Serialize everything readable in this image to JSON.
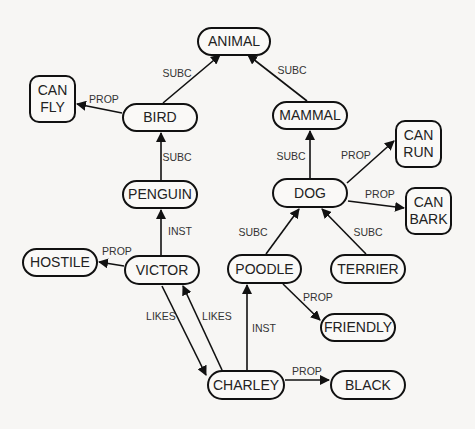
{
  "diagram": {
    "type": "semantic-network",
    "colors": {
      "background": "#f7f6f4",
      "stroke": "#111111",
      "text": "#222222"
    },
    "nodes": [
      {
        "id": "animal",
        "label": "ANIMAL",
        "shape": "pill",
        "x": 197,
        "y": 27,
        "w": 74,
        "h": 29
      },
      {
        "id": "canfly",
        "label": "CAN\nFLY",
        "shape": "box",
        "x": 29,
        "y": 75,
        "w": 47,
        "h": 48
      },
      {
        "id": "bird",
        "label": "BIRD",
        "shape": "pill",
        "x": 122,
        "y": 103,
        "w": 76,
        "h": 29
      },
      {
        "id": "mammal",
        "label": "MAMMAL",
        "shape": "pill",
        "x": 272,
        "y": 101,
        "w": 76,
        "h": 29
      },
      {
        "id": "canrun",
        "label": "CAN\nRUN",
        "shape": "box",
        "x": 395,
        "y": 120,
        "w": 47,
        "h": 48
      },
      {
        "id": "penguin",
        "label": "PENGUIN",
        "shape": "pill",
        "x": 122,
        "y": 180,
        "w": 76,
        "h": 29
      },
      {
        "id": "dog",
        "label": "DOG",
        "shape": "pill",
        "x": 272,
        "y": 178,
        "w": 76,
        "h": 30
      },
      {
        "id": "canbark",
        "label": "CAN\nBARK",
        "shape": "box",
        "x": 405,
        "y": 187,
        "w": 47,
        "h": 48
      },
      {
        "id": "hostile",
        "label": "HOSTILE",
        "shape": "pill",
        "x": 22,
        "y": 248,
        "w": 76,
        "h": 29
      },
      {
        "id": "victor",
        "label": "VICTOR",
        "shape": "pill",
        "x": 124,
        "y": 255,
        "w": 76,
        "h": 30
      },
      {
        "id": "poodle",
        "label": "POODLE",
        "shape": "pill",
        "x": 227,
        "y": 254,
        "w": 75,
        "h": 30
      },
      {
        "id": "terrier",
        "label": "TERRIER",
        "shape": "pill",
        "x": 330,
        "y": 254,
        "w": 76,
        "h": 30
      },
      {
        "id": "friendly",
        "label": "FRIENDLY",
        "shape": "pill",
        "x": 320,
        "y": 313,
        "w": 76,
        "h": 29
      },
      {
        "id": "charley",
        "label": "CHARLEY",
        "shape": "pill",
        "x": 207,
        "y": 370,
        "w": 78,
        "h": 30
      },
      {
        "id": "black",
        "label": "BLACK",
        "shape": "pill",
        "x": 330,
        "y": 370,
        "w": 76,
        "h": 30
      }
    ],
    "edges": [
      {
        "from": "bird",
        "to": "animal",
        "label": "SUBC",
        "x1": 163,
        "y1": 103,
        "x2": 220,
        "y2": 55,
        "lx": 177,
        "ly": 73
      },
      {
        "from": "mammal",
        "to": "animal",
        "label": "SUBC",
        "x1": 307,
        "y1": 101,
        "x2": 248,
        "y2": 55,
        "lx": 292,
        "ly": 70
      },
      {
        "from": "bird",
        "to": "canfly",
        "label": "PROP",
        "x1": 122,
        "y1": 113,
        "x2": 77,
        "y2": 104,
        "lx": 104,
        "ly": 99
      },
      {
        "from": "penguin",
        "to": "bird",
        "label": "SUBC",
        "x1": 161,
        "y1": 180,
        "x2": 161,
        "y2": 133,
        "lx": 177,
        "ly": 157
      },
      {
        "from": "dog",
        "to": "mammal",
        "label": "SUBC",
        "x1": 310,
        "y1": 178,
        "x2": 310,
        "y2": 131,
        "lx": 291,
        "ly": 156
      },
      {
        "from": "dog",
        "to": "canrun",
        "label": "PROP",
        "x1": 347,
        "y1": 183,
        "x2": 394,
        "y2": 141,
        "lx": 356,
        "ly": 155
      },
      {
        "from": "dog",
        "to": "canbark",
        "label": "PROP",
        "x1": 348,
        "y1": 201,
        "x2": 404,
        "y2": 208,
        "lx": 380,
        "ly": 194
      },
      {
        "from": "victor",
        "to": "penguin",
        "label": "INST",
        "x1": 161,
        "y1": 255,
        "x2": 161,
        "y2": 210,
        "lx": 180,
        "ly": 231
      },
      {
        "from": "victor",
        "to": "hostile",
        "label": "PROP",
        "x1": 124,
        "y1": 266,
        "x2": 99,
        "y2": 262,
        "lx": 117,
        "ly": 251
      },
      {
        "from": "poodle",
        "to": "dog",
        "label": "SUBC",
        "x1": 266,
        "y1": 254,
        "x2": 299,
        "y2": 209,
        "lx": 253,
        "ly": 232
      },
      {
        "from": "terrier",
        "to": "dog",
        "label": "SUBC",
        "x1": 366,
        "y1": 254,
        "x2": 322,
        "y2": 209,
        "lx": 368,
        "ly": 232
      },
      {
        "from": "poodle",
        "to": "friendly",
        "label": "PROP",
        "x1": 283,
        "y1": 284,
        "x2": 320,
        "y2": 320,
        "lx": 318,
        "ly": 297
      },
      {
        "from": "victor",
        "to": "charley",
        "label": "LIKES",
        "x1": 162,
        "y1": 286,
        "x2": 206,
        "y2": 375,
        "lx": 161,
        "ly": 316
      },
      {
        "from": "charley",
        "to": "victor",
        "label": "LIKES",
        "x1": 222,
        "y1": 370,
        "x2": 183,
        "y2": 286,
        "lx": 217,
        "ly": 316
      },
      {
        "from": "charley",
        "to": "poodle",
        "label": "INST",
        "x1": 247,
        "y1": 370,
        "x2": 247,
        "y2": 285,
        "lx": 264,
        "ly": 328
      },
      {
        "from": "charley",
        "to": "black",
        "label": "PROP",
        "x1": 285,
        "y1": 380,
        "x2": 329,
        "y2": 380,
        "lx": 307,
        "ly": 371
      }
    ]
  }
}
